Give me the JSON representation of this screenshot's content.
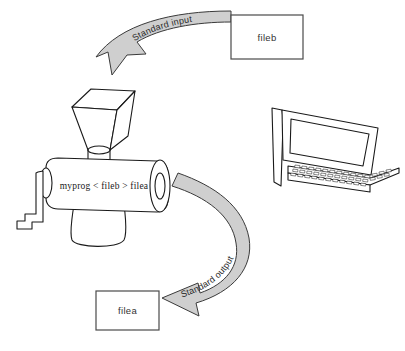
{
  "figure": {
    "background_color": "#ffffff",
    "line_color": "#1a1a1a",
    "arrow_fill_color": "#cfcfcf",
    "arrow_outline_color": "#3a3a3a"
  },
  "boxes": {
    "input_file": {
      "label": "fileb",
      "x": 231,
      "y": 15,
      "width": 72,
      "height": 44
    },
    "output_file": {
      "label": "filea",
      "x": 96,
      "y": 291,
      "width": 63,
      "height": 39
    }
  },
  "arrows": {
    "standard_input": {
      "label": "Standard input",
      "from": "fileb",
      "to": "grinder-hopper",
      "direction": "down-left"
    },
    "standard_output": {
      "label": "Standard output",
      "from": "grinder-nozzle",
      "to": "filea",
      "direction": "left"
    }
  },
  "grinder": {
    "command_label": "myprog < fileb > filea",
    "parts": [
      "hopper",
      "hopper-neck",
      "body-cylinder",
      "nozzle",
      "crank-handle",
      "pedestal-base"
    ]
  },
  "computer": {
    "name": "desktop-computer",
    "parts": [
      "monitor-case",
      "screen",
      "keyboard",
      "keyboard-base"
    ]
  }
}
